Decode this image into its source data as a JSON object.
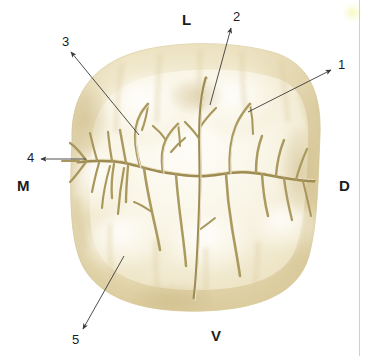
{
  "figure": {
    "background_color": "#ffffff"
  },
  "palette": {
    "enamel_lightest": "#fdfcf4",
    "enamel_light": "#f8f4e2",
    "enamel_mid": "#efe7c9",
    "enamel_tan": "#e2d6ab",
    "enamel_dark": "#d2c28d",
    "groove_line": "#b3a268",
    "groove_dark": "#9c8b53",
    "leader_line": "#3a3a3a",
    "text": "#1c1c1c",
    "page_edge": "#cfcfcf",
    "highlight_mark": "#e9f06a"
  },
  "callouts": [
    {
      "id": "callout-1",
      "label": "1",
      "label_x": 338,
      "label_y": 65,
      "line": {
        "x1": 331,
        "y1": 70,
        "x2": 248,
        "y2": 112
      },
      "arrow_at": "label",
      "arrow_x": 331,
      "arrow_y": 70
    },
    {
      "id": "callout-2",
      "label": "2",
      "label_x": 233,
      "label_y": 17,
      "line": {
        "x1": 231,
        "y1": 28,
        "x2": 210,
        "y2": 105
      },
      "arrow_at": "label",
      "arrow_x": 231,
      "arrow_y": 28
    },
    {
      "id": "callout-3",
      "label": "3",
      "label_x": 64,
      "label_y": 42,
      "line": {
        "x1": 71,
        "y1": 52,
        "x2": 139,
        "y2": 135
      },
      "arrow_at": "label",
      "arrow_x": 71,
      "arrow_y": 52
    },
    {
      "id": "callout-4",
      "label": "4",
      "label_x": 29,
      "label_y": 156,
      "line": {
        "x1": 41,
        "y1": 159,
        "x2": 86,
        "y2": 159
      },
      "arrow_at": "label",
      "arrow_x": 41,
      "arrow_y": 159
    },
    {
      "id": "callout-5",
      "label": "5",
      "label_x": 74,
      "label_y": 339,
      "line": {
        "x1": 83,
        "y1": 329,
        "x2": 124,
        "y2": 256
      },
      "arrow_at": "label",
      "arrow_x": 83,
      "arrow_y": 329
    }
  ],
  "orientation_markers": [
    {
      "id": "marker-lingual",
      "label": "L",
      "x": 182,
      "y": 12,
      "meaning": "lingual"
    },
    {
      "id": "marker-mesial",
      "label": "M",
      "x": 17,
      "y": 178,
      "meaning": "mesial"
    },
    {
      "id": "marker-distal",
      "label": "D",
      "x": 339,
      "y": 178,
      "meaning": "distal"
    },
    {
      "id": "marker-vestibular",
      "label": "V",
      "x": 211,
      "y": 328,
      "meaning": "vestibular"
    }
  ],
  "page_edge": {
    "x": 359
  },
  "highlight_mark": {
    "x": 347,
    "y": 7,
    "size": 11
  }
}
